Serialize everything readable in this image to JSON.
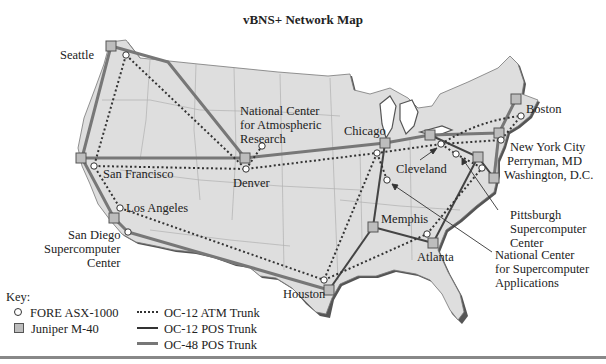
{
  "title": "vBNS+ Network Map",
  "colors": {
    "land": "#dedede",
    "land_shadow": "#555555",
    "state_border": "#b0b0b0",
    "oc12_atm": "#333333",
    "oc12_pos": "#444444",
    "oc48_pos": "#777777",
    "juniper_fill": "#bdbdbd"
  },
  "sites": [
    {
      "name": "Seattle",
      "type": "juniper",
      "x": 111,
      "y": 46
    },
    {
      "name": "Seattle-FORE",
      "type": "fore",
      "x": 126,
      "y": 55
    },
    {
      "name": "San Francisco",
      "type": "juniper",
      "x": 81,
      "y": 158
    },
    {
      "name": "San Francisco-FORE",
      "type": "fore",
      "x": 94,
      "y": 166
    },
    {
      "name": "Los Angeles",
      "type": "fore",
      "x": 120,
      "y": 208
    },
    {
      "name": "Los Angeles-Juniper",
      "type": "juniper",
      "x": 114,
      "y": 218
    },
    {
      "name": "San Diego Supercomputer Center",
      "type": "fore",
      "x": 128,
      "y": 232
    },
    {
      "name": "Denver",
      "type": "juniper",
      "x": 245,
      "y": 158
    },
    {
      "name": "Denver-FORE",
      "type": "fore",
      "x": 246,
      "y": 169
    },
    {
      "name": "National Center for Atmospheric Research",
      "type": "fore",
      "x": 262,
      "y": 146
    },
    {
      "name": "Chicago",
      "type": "juniper",
      "x": 385,
      "y": 143
    },
    {
      "name": "Chicago-FORE",
      "type": "fore",
      "x": 377,
      "y": 153
    },
    {
      "name": "National Center for Supercomputer Applications",
      "type": "fore",
      "x": 387,
      "y": 180
    },
    {
      "name": "Cleveland",
      "type": "fore",
      "x": 441,
      "y": 144
    },
    {
      "name": "Cleveland-Juniper",
      "type": "juniper",
      "x": 430,
      "y": 135
    },
    {
      "name": "Michigan-Juniper",
      "type": "juniper",
      "x": 385,
      "y": 143
    },
    {
      "name": "Pittsburgh Supercomputer Center",
      "type": "fore",
      "x": 456,
      "y": 154
    },
    {
      "name": "New York City",
      "type": "juniper",
      "x": 499,
      "y": 133
    },
    {
      "name": "New York City-FORE",
      "type": "fore",
      "x": 501,
      "y": 140
    },
    {
      "name": "Boston",
      "type": "juniper",
      "x": 516,
      "y": 99
    },
    {
      "name": "Boston-FORE",
      "type": "fore",
      "x": 521,
      "y": 116
    },
    {
      "name": "Perryman, MD",
      "type": "juniper",
      "x": 478,
      "y": 157
    },
    {
      "name": "Perryman-FORE",
      "type": "fore",
      "x": 482,
      "y": 168
    },
    {
      "name": "Washington, D.C.",
      "type": "juniper",
      "x": 494,
      "y": 178
    },
    {
      "name": "Memphis",
      "type": "juniper",
      "x": 373,
      "y": 227
    },
    {
      "name": "Atlanta",
      "type": "juniper",
      "x": 433,
      "y": 243
    },
    {
      "name": "Atlanta-FORE",
      "type": "fore",
      "x": 427,
      "y": 234
    },
    {
      "name": "Houston",
      "type": "juniper",
      "x": 329,
      "y": 290
    },
    {
      "name": "Houston-FORE",
      "type": "fore",
      "x": 324,
      "y": 280
    }
  ],
  "labels": [
    {
      "id": "seattle",
      "text": "Seattle",
      "x": 60,
      "y": 48
    },
    {
      "id": "ncar",
      "lines": [
        "National Center",
        "for Atmospheric",
        "Research"
      ],
      "x": 240,
      "y": 103
    },
    {
      "id": "chicago",
      "text": "Chicago",
      "x": 345,
      "y": 124
    },
    {
      "id": "boston",
      "text": "Boston",
      "x": 527,
      "y": 102
    },
    {
      "id": "sanfrancisco",
      "text": "San Francisco",
      "x": 103,
      "y": 168
    },
    {
      "id": "denver",
      "text": "Denver",
      "x": 233,
      "y": 176
    },
    {
      "id": "cleveland",
      "text": "Cleveland",
      "x": 396,
      "y": 162
    },
    {
      "id": "nyc",
      "text": "New York City",
      "x": 510,
      "y": 140
    },
    {
      "id": "perryman",
      "text": "Perryman, MD",
      "x": 506,
      "y": 154
    },
    {
      "id": "washington",
      "text": "Washington, D.C.",
      "x": 504,
      "y": 168
    },
    {
      "id": "losangeles",
      "text": "Los Angeles",
      "x": 125,
      "y": 202
    },
    {
      "id": "sandiego",
      "lines": [
        "San Diego",
        "Supercomputer",
        "Center"
      ],
      "x": 48,
      "y": 228,
      "align": "right"
    },
    {
      "id": "memphis",
      "text": "Memphis",
      "x": 380,
      "y": 214
    },
    {
      "id": "psc",
      "lines": [
        "Pittsburgh",
        "Supercomputer",
        "Center"
      ],
      "x": 510,
      "y": 208
    },
    {
      "id": "ncsa",
      "lines": [
        "National Center",
        "for Supercomputer",
        "Applications"
      ],
      "x": 495,
      "y": 249
    },
    {
      "id": "atlanta",
      "text": "Atlanta",
      "x": 413,
      "y": 250
    },
    {
      "id": "houston",
      "text": "Houston",
      "x": 284,
      "y": 286
    }
  ],
  "key": {
    "heading": "Key:",
    "nodes": [
      {
        "symbol": "circle",
        "label": "FORE ASX-1000"
      },
      {
        "symbol": "square",
        "label": "Juniper M-40"
      }
    ],
    "links": [
      {
        "style": "dotted",
        "label": "OC-12 ATM Trunk"
      },
      {
        "style": "solid-dark",
        "label": "OC-12 POS Trunk"
      },
      {
        "style": "solid-thick",
        "label": "OC-48 POS Trunk"
      }
    ]
  }
}
